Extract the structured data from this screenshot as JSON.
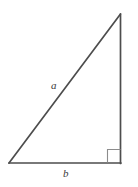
{
  "figure": {
    "type": "right-triangle-diagram",
    "background_color": "#ffffff",
    "stroke_color": "#4d4d4d",
    "label_color": "#3a3a3a",
    "stroke_width": 1.6,
    "width": 138,
    "height": 187,
    "vertices": {
      "bottom_left": {
        "x": 9,
        "y": 163
      },
      "bottom_right": {
        "x": 120.5,
        "y": 163
      },
      "apex": {
        "x": 120.5,
        "y": 14
      }
    },
    "right_angle_marker": {
      "name": "right-angle-marker",
      "corner": "bottom-right",
      "size": 13,
      "stroke_color": "#8c8c8c",
      "stroke_width": 1.1
    },
    "labels": {
      "hypotenuse": "a",
      "base": "b"
    },
    "sides": [
      {
        "name": "hypotenuse",
        "label": "a",
        "from": "bottom_left",
        "to": "apex"
      },
      {
        "name": "base",
        "label": "b",
        "from": "bottom_left",
        "to": "bottom_right"
      },
      {
        "name": "vertical-leg",
        "label": "",
        "from": "bottom_right",
        "to": "apex"
      }
    ]
  }
}
